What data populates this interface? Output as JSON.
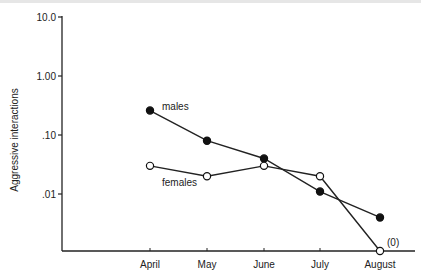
{
  "chart_data": {
    "type": "line",
    "title": "",
    "xlabel": "",
    "ylabel": "Aggressive interactions",
    "yscale": "log",
    "ylim": [
      0.001,
      10.0
    ],
    "y_ticks": [
      {
        "value": 10.0,
        "label": "10.0"
      },
      {
        "value": 1.0,
        "label": "1.00"
      },
      {
        "value": 0.1,
        "label": ".10"
      },
      {
        "value": 0.01,
        "label": ".01"
      }
    ],
    "categories": [
      "April",
      "May",
      "June",
      "July",
      "August"
    ],
    "series": [
      {
        "name": "males",
        "marker": "filled-circle",
        "values": [
          0.26,
          0.08,
          0.04,
          0.011,
          0.004
        ]
      },
      {
        "name": "females",
        "marker": "open-circle",
        "values": [
          0.03,
          0.02,
          0.03,
          0.02,
          0
        ]
      }
    ],
    "annotations": [
      {
        "text": "(0)",
        "target": "females-August"
      }
    ],
    "grid": false,
    "legend": "inline labels"
  }
}
